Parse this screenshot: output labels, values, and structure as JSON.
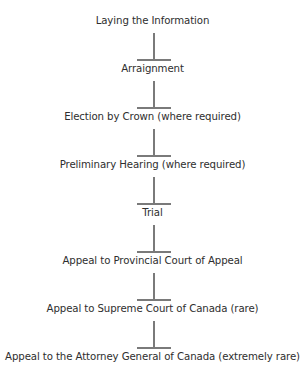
{
  "diagram": {
    "type": "flowchart",
    "direction": "top-to-bottom",
    "connector_style": "inverted-T",
    "colors": {
      "text": "#2e2e2e",
      "connector": "#7a7a7a",
      "background": "#ffffff"
    },
    "steps": [
      {
        "label": "Laying the Information"
      },
      {
        "label": "Arraignment"
      },
      {
        "label": "Election by Crown (where required)"
      },
      {
        "label": "Preliminary Hearing (where required)"
      },
      {
        "label": "Trial"
      },
      {
        "label": "Appeal to Provincial Court of Appeal"
      },
      {
        "label": "Appeal to Supreme Court of Canada (rare)"
      },
      {
        "label": "Appeal to the Attorney General of Canada (extremely rare)"
      }
    ]
  }
}
